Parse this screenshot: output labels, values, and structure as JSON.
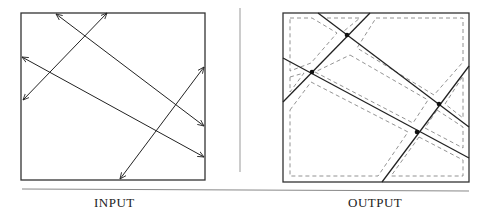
{
  "labels": {
    "input": "INPUT",
    "output": "OUTPUT"
  },
  "colors": {
    "line": "#222222",
    "dashed": "#777777",
    "rule": "#888888"
  }
}
